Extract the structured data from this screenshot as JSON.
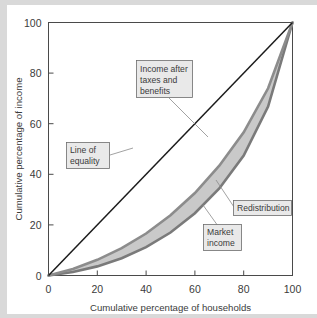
{
  "chart_data": {
    "type": "line",
    "title": "",
    "xlabel": "Cumulative percentage of households",
    "ylabel": "Cumulative percentage of income",
    "xlim": [
      0,
      100
    ],
    "ylim": [
      0,
      100
    ],
    "xticks": [
      "0",
      "20",
      "40",
      "60",
      "80",
      "100"
    ],
    "yticks": [
      "0",
      "20",
      "40",
      "60",
      "80",
      "100"
    ],
    "xtick_values": [
      0,
      20,
      40,
      60,
      80,
      100
    ],
    "ytick_values": [
      0,
      20,
      40,
      60,
      80,
      100
    ],
    "grid": false,
    "legend_position": "none",
    "x": [
      0,
      10,
      20,
      30,
      40,
      50,
      60,
      70,
      80,
      90,
      100
    ],
    "series": [
      {
        "name": "Line of equality",
        "values": [
          0,
          10,
          20,
          30,
          40,
          50,
          60,
          70,
          80,
          90,
          100
        ],
        "color": "#1b1b1b"
      },
      {
        "name": "Income after taxes and benefits",
        "values": [
          0,
          2.6,
          6.2,
          10.8,
          16.6,
          23.8,
          32.6,
          43.4,
          56.6,
          74.0,
          100
        ],
        "color": "#8c8c8c"
      },
      {
        "name": "Market income",
        "values": [
          0,
          1.4,
          3.6,
          6.8,
          11.2,
          17.0,
          24.6,
          34.4,
          47.4,
          66.8,
          100
        ],
        "color": "#7a7a7a"
      }
    ],
    "band": {
      "name": "Redistribution",
      "upper_series": "Income after taxes and benefits",
      "lower_series": "Market income",
      "fill_color": "#c9c9c9"
    },
    "annotations": [
      {
        "id": "income-after-taxes",
        "label_lines": [
          "Income after",
          "taxes and",
          "benefits"
        ],
        "text": "Income after taxes and benefits"
      },
      {
        "id": "line-of-equality",
        "label_lines": [
          "Line of",
          "equality"
        ],
        "text": "Line of equality"
      },
      {
        "id": "redistribution",
        "label_lines": [
          "Redistribution"
        ],
        "text": "Redistribution"
      },
      {
        "id": "market-income",
        "label_lines": [
          "Market",
          "income"
        ],
        "text": "Market income"
      }
    ]
  },
  "colors": {
    "background": "#ffffff",
    "axis": "#4a4a4a",
    "equality_line": "#1b1b1b",
    "band_fill": "#c9c9c9",
    "curve_stroke": "#8c8c8c",
    "callout_fill": "#e9e9e9",
    "callout_stroke": "#6d6d6d",
    "text": "#3b3b3b"
  }
}
